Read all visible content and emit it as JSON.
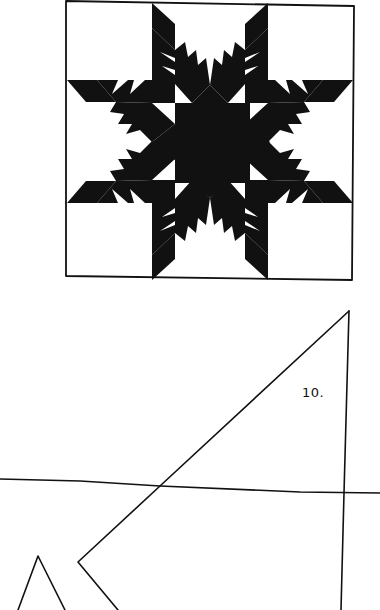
{
  "figure": {
    "type": "quilt-block-pattern",
    "block_name_visible": false,
    "colors": {
      "ink": "#111111",
      "paper": "#ffffff"
    },
    "block": {
      "frame": {
        "tl": [
          66,
          1
        ],
        "tr": [
          354,
          6
        ],
        "br": [
          352,
          280
        ],
        "bl": [
          66,
          276
        ]
      },
      "center": [
        210,
        142
      ]
    },
    "template_piece": {
      "label": "10.",
      "label_position": [
        302,
        385
      ]
    }
  }
}
